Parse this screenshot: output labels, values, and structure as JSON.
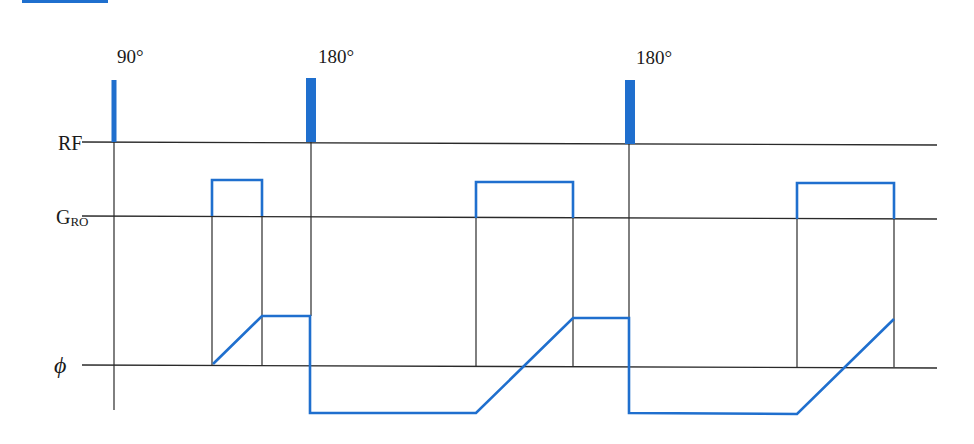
{
  "diagram": {
    "colors": {
      "pulse": "#1f6fce",
      "axis": "#2a2a2a",
      "top_bar": "#1f6fce"
    },
    "rows": [
      {
        "id": "rf",
        "label": "RF",
        "y": 142
      },
      {
        "id": "gro",
        "label": "G",
        "subscript": "RO",
        "y": 216
      },
      {
        "id": "phi",
        "label": "ϕ",
        "y": 365
      }
    ],
    "rf_pulses": [
      {
        "label": "90°",
        "x": 114,
        "width": 5,
        "top": 80
      },
      {
        "label": "180°",
        "x": 311,
        "width": 10,
        "top": 78
      },
      {
        "label": "180°",
        "x": 630,
        "width": 10,
        "top": 80
      }
    ],
    "readout_gradients": [
      {
        "x1": 212,
        "x2": 262,
        "top": 180
      },
      {
        "x1": 476,
        "x2": 573,
        "top": 182
      },
      {
        "x1": 797,
        "x2": 894,
        "top": 183
      }
    ],
    "phase_waveform": [
      [
        213,
        364
      ],
      [
        262,
        316
      ],
      [
        310,
        316
      ],
      [
        310,
        413
      ],
      [
        476,
        413
      ],
      [
        573,
        318
      ],
      [
        629,
        318
      ],
      [
        629,
        413
      ],
      [
        797,
        414
      ],
      [
        894,
        319
      ]
    ],
    "axis_line_x_start": 110,
    "axis_line_x_end": 937
  }
}
